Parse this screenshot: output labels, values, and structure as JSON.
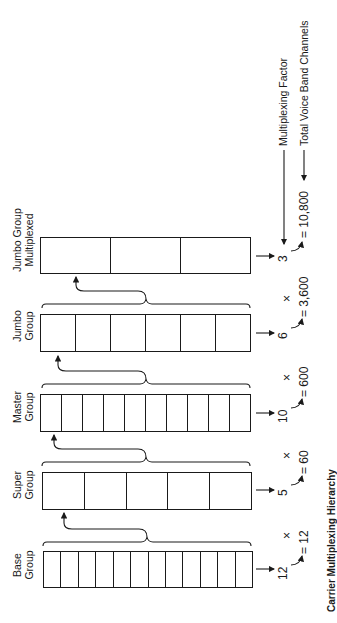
{
  "groups": [
    {
      "label_line1": "Jumbo Group",
      "label_line2": "Multiplexed",
      "cells": 3,
      "factor": "3",
      "result": "= 10,800"
    },
    {
      "label_line1": "Jumbo",
      "label_line2": "Group",
      "cells": 6,
      "factor": "6",
      "result": "= 3,600"
    },
    {
      "label_line1": "Master",
      "label_line2": "Group",
      "cells": 10,
      "factor": "10",
      "result": "= 600"
    },
    {
      "label_line1": "Super",
      "label_line2": "Group",
      "cells": 5,
      "factor": "5",
      "result": "= 60"
    },
    {
      "label_line1": "Base",
      "label_line2": "Group",
      "cells": 12,
      "factor": "12",
      "result": "= 12"
    }
  ],
  "operators": {
    "times": "×"
  },
  "legend": {
    "multiplexing_factor": "Multiplexing Factor",
    "total_channels": "Total Voice Band Channels"
  },
  "caption": "Carrier Multiplexing Hierarchy"
}
